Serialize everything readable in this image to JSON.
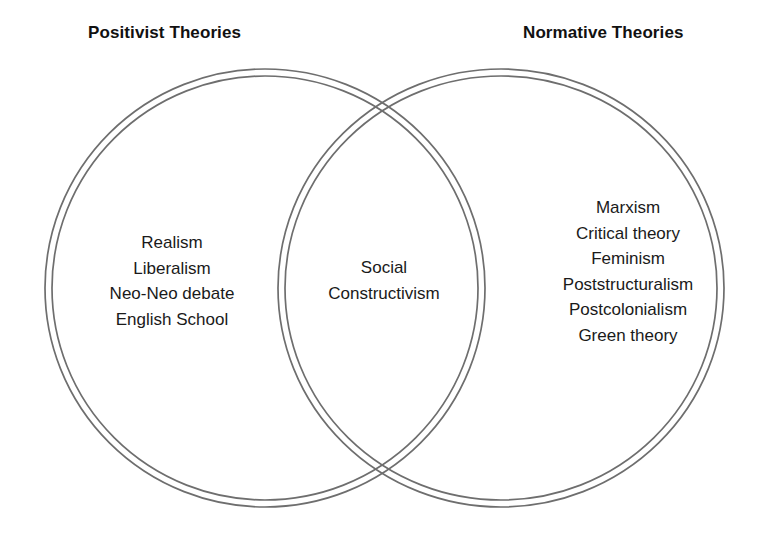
{
  "diagram": {
    "type": "venn-2-set",
    "stroke_color": "#6e6e6e",
    "text_color": "#1a1a1a",
    "background_color": "#ffffff",
    "left_heading": "Positivist Theories",
    "right_heading": "Normative Theories",
    "sets": {
      "left": {
        "heading": "Positivist Theories",
        "items": [
          "Realism",
          "Liberalism",
          "Neo-Neo debate",
          "English School"
        ]
      },
      "intersection": {
        "items": [
          "Social",
          "Constructivism"
        ]
      },
      "right": {
        "heading": "Normative Theories",
        "items": [
          "Marxism",
          "Critical theory",
          "Feminism",
          "Poststructuralism",
          "Postcolonialism",
          "Green theory"
        ]
      }
    }
  }
}
